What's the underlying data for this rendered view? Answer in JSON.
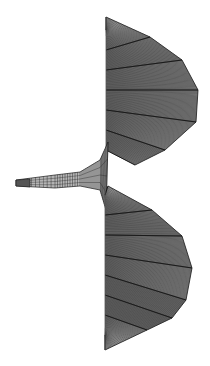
{
  "figure": {
    "colors": {
      "background": "#ffffff",
      "fill": "#9a9a9a",
      "fill_light": "#b4b4b4",
      "line": "#1a1a1a"
    },
    "upper_lobe": {
      "spine_x": 106,
      "top": 17,
      "bottom": 140,
      "outline": [
        [
          106,
          17
        ],
        [
          150,
          37
        ],
        [
          182,
          60
        ],
        [
          198,
          90
        ],
        [
          196,
          122
        ],
        [
          165,
          150
        ],
        [
          135,
          165
        ]
      ],
      "spokes": 7,
      "rings": 34
    },
    "lower_lobe": {
      "spine_x": 105,
      "top": 186,
      "bottom": 350,
      "outline": [
        [
          108,
          186
        ],
        [
          152,
          210
        ],
        [
          182,
          236
        ],
        [
          192,
          268
        ],
        [
          186,
          300
        ],
        [
          172,
          318
        ],
        [
          147,
          330
        ],
        [
          105,
          350
        ]
      ],
      "spokes": 8,
      "rings": 34
    },
    "neck": {
      "tip": [
        16,
        182
      ],
      "upper_edge": [
        [
          16,
          180
        ],
        [
          55,
          175
        ],
        [
          80,
          172
        ],
        [
          100,
          160
        ],
        [
          108,
          142
        ]
      ],
      "lower_edge": [
        [
          16,
          186
        ],
        [
          55,
          188
        ],
        [
          80,
          186
        ],
        [
          100,
          190
        ],
        [
          106,
          210
        ]
      ]
    }
  }
}
